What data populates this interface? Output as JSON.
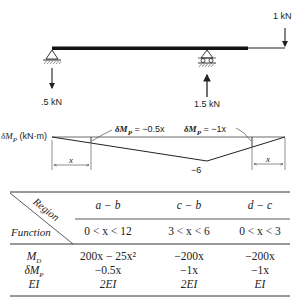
{
  "beam": {
    "load_top": "1 kN",
    "reaction_left": ".5 kN",
    "reaction_right": "1.5 kN"
  },
  "moment_diagram": {
    "axis_label_main": "δM",
    "axis_label_sub": "P",
    "axis_label_unit": "(kN·m)",
    "annot_left_main": "δM",
    "annot_left_sub": "P",
    "annot_left_expr": "= −0.5x",
    "annot_right_main": "δM",
    "annot_right_sub": "P",
    "annot_right_expr": "= −1x",
    "min_value": "−6",
    "dim_left": "x",
    "dim_right": "x"
  },
  "table": {
    "corner_region": "Region",
    "corner_function": "Function",
    "columns": [
      {
        "region": "a − b",
        "range": "0 < x < 12"
      },
      {
        "region": "c − b",
        "range": "3 < x < 6"
      },
      {
        "region": "d − c",
        "range": "0 < x < 3"
      }
    ],
    "rows": [
      {
        "label_main": "M",
        "label_sub": "D",
        "values": [
          "200x − 25x²",
          "−200x",
          "−200x"
        ]
      },
      {
        "label_main": "δM",
        "label_sub": "P",
        "values": [
          "−0.5x",
          "−1x",
          "−1x"
        ]
      },
      {
        "label_main": "EI",
        "label_sub": "",
        "values": [
          "2EI",
          "2EI",
          "EI"
        ]
      }
    ]
  }
}
